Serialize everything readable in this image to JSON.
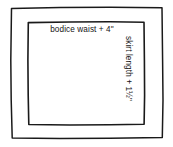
{
  "diagram": {
    "background_color": "#ffffff",
    "ink_color": "#1a1a1a",
    "outer_rectangle": {
      "name": "fabric-outline",
      "label": ""
    },
    "inner_rectangle": {
      "name": "skirt-piece-outline",
      "label": ""
    },
    "labels": {
      "width_measurement": "bodice waist + 4\"",
      "length_measurement": "skirt length + 1½\""
    }
  }
}
